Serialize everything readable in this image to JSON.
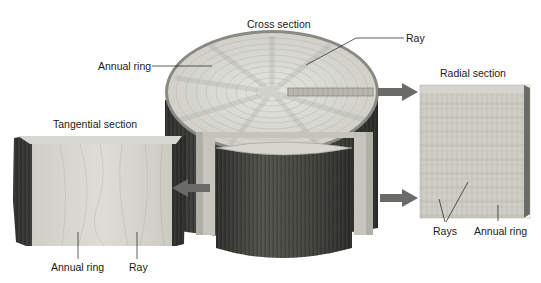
{
  "diagram": {
    "type": "labeled-illustration",
    "colors": {
      "wood_light": "#dcdcd6",
      "wood_mid": "#c8c8c0",
      "bark_dark": "#3a3a38",
      "bark_mid": "#5a5a56",
      "arrow": "#6a6a68",
      "leader_line": "#1a1a1a",
      "text": "#1a1a1a"
    },
    "sections": {
      "cross": {
        "title": "Cross section",
        "labels": {
          "annual_ring": "Annual ring",
          "ray": "Ray"
        }
      },
      "radial": {
        "title": "Radial section",
        "labels": {
          "rays": "Rays",
          "annual_ring": "Annual ring"
        }
      },
      "tangential": {
        "title": "Tangential section",
        "labels": {
          "annual_ring": "Annual ring",
          "ray": "Ray"
        }
      }
    },
    "arrows": [
      {
        "from": "cross-section-ray-strip",
        "to": "radial-section",
        "direction": "right"
      },
      {
        "from": "log-side",
        "to": "radial-section",
        "direction": "right"
      },
      {
        "from": "log-cut",
        "to": "tangential-section",
        "direction": "left"
      }
    ]
  }
}
